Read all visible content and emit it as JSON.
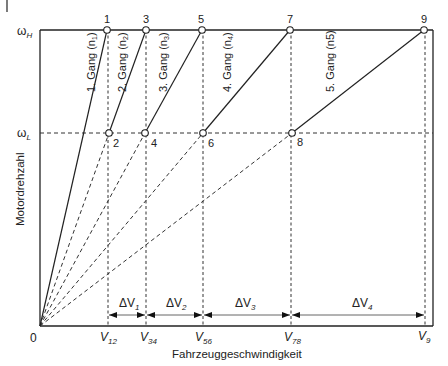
{
  "diagram": {
    "type": "gear-shift sawtooth diagram",
    "y_axis": {
      "title": "Motordrehzahl",
      "ticks": [
        {
          "label": "ω",
          "sub": "H",
          "meaning": "omega_H (upper engine speed)"
        },
        {
          "label": "ω",
          "sub": "L",
          "meaning": "omega_L (lower engine speed)"
        }
      ]
    },
    "x_axis": {
      "title": "Fahrzeuggeschwindigkeit",
      "origin_label": "0",
      "ticks": [
        {
          "label": "V",
          "sub": "12"
        },
        {
          "label": "V",
          "sub": "34"
        },
        {
          "label": "V",
          "sub": "56"
        },
        {
          "label": "V",
          "sub": "78"
        },
        {
          "label": "V",
          "sub": "9"
        }
      ]
    },
    "points": [
      "1",
      "2",
      "3",
      "4",
      "5",
      "6",
      "7",
      "8",
      "9"
    ],
    "gears": [
      {
        "label": "1. Gang (n",
        "sub": "1",
        "suffix": ")"
      },
      {
        "label": "2. Gang (n",
        "sub": "2",
        "suffix": ")"
      },
      {
        "label": "3. Gang (n",
        "sub": "3",
        "suffix": ")"
      },
      {
        "label": "4. Gang (n",
        "sub": "4",
        "suffix": ")"
      },
      {
        "label": "5. Gang (n5)",
        "sub": "",
        "suffix": ""
      }
    ],
    "deltas": [
      {
        "label": "ΔV",
        "sub": "1"
      },
      {
        "label": "ΔV",
        "sub": "2"
      },
      {
        "label": "ΔV",
        "sub": "3"
      },
      {
        "label": "ΔV",
        "sub": "4"
      }
    ],
    "colors": {
      "line": "#222222",
      "dashed": "#333333",
      "marker_fill": "#ffffff"
    }
  }
}
